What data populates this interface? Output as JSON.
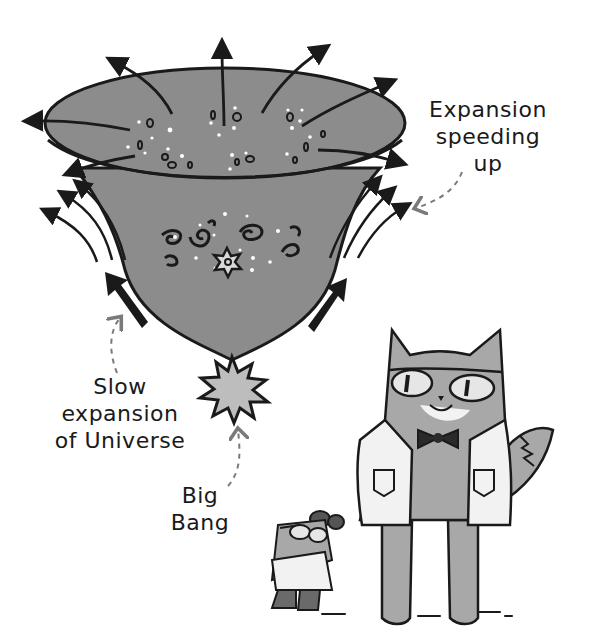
{
  "figure": {
    "colors": {
      "background": "#ffffff",
      "ink": "#1a1a1a",
      "universe_fill": "#8c8c8c",
      "big_bang_fill": "#bdbdbd",
      "dashed_pointer": "#7a7a7a",
      "cat_fur": "#a8a8a8",
      "coat": "#f2f2f2"
    }
  },
  "labels": {
    "expansion_speeding_up": [
      "Expansion",
      "speeding",
      "up"
    ],
    "slow_expansion": [
      "Slow",
      "expansion",
      "of Universe"
    ],
    "big_bang": [
      "Big",
      "Bang"
    ]
  },
  "characters": [
    {
      "name": "cat-scientist",
      "description": "tall cat with goggles, bow tie and lab coat"
    },
    {
      "name": "mouse-scientist",
      "description": "small mouse with goggles and lab coat"
    }
  ]
}
